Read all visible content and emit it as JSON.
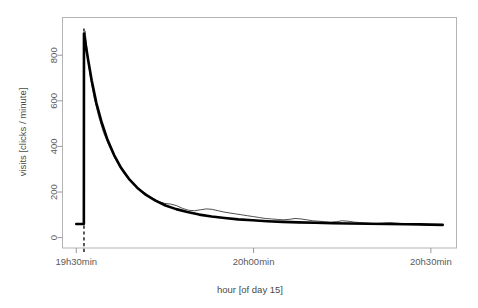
{
  "chart_data": {
    "type": "line",
    "title": "",
    "subtitle": "",
    "xlabel": "hour [of day 15]",
    "ylabel": "visits [clicks / minute]",
    "xlim": [
      0,
      62
    ],
    "ylim": [
      0,
      920
    ],
    "grid": false,
    "legend": false,
    "legend_position": "none",
    "x_tick_labels": [
      "19h30min",
      "20h00min",
      "20h30min"
    ],
    "x_tick_values": [
      0,
      30,
      60
    ],
    "y_tick_labels": [
      "0",
      "200",
      "400",
      "600",
      "800"
    ],
    "y_tick_values": [
      0,
      200,
      400,
      600,
      800
    ],
    "annotations": [
      {
        "name": "event-onset-dashed-line",
        "type": "vertical-dashed-line",
        "x": 1.3,
        "label": ""
      }
    ],
    "series": [
      {
        "name": "measured visits",
        "style": "thin-line",
        "color": "#3b3b3b",
        "x": [
          0,
          0.4,
          0.8,
          1.1,
          1.25,
          1.3,
          1.5,
          1.9,
          2.4,
          3.0,
          3.8,
          4.6,
          5.5,
          6.4,
          7.3,
          8.2,
          9.1,
          10.0,
          11.0,
          12.0,
          13.0,
          14.0,
          15.0,
          16.0,
          17.0,
          18.0,
          19.0,
          20.0,
          21.0,
          22.0,
          23.0,
          24.0,
          25.0,
          26.0,
          27.0,
          28.0,
          29.0,
          30.0,
          31.0,
          32.0,
          33.0,
          34.0,
          35.0,
          36.0,
          37.0,
          38.0,
          39.0,
          40.0,
          41.0,
          42.0,
          43.0,
          44.0,
          45.0,
          46.0,
          47.0,
          48.0,
          49.0,
          50.0,
          51.0,
          52.0,
          53.0,
          54.0,
          55.0,
          56.0,
          57.0,
          58.0,
          59.0,
          60.0,
          61.0,
          62.0
        ],
        "y": [
          60,
          60,
          60,
          60,
          62,
          880,
          905,
          800,
          700,
          615,
          530,
          462,
          405,
          355,
          312,
          276,
          248,
          226,
          205,
          190,
          172,
          158,
          150,
          147,
          140,
          128,
          120,
          118,
          122,
          126,
          124,
          118,
          112,
          108,
          104,
          100,
          96,
          92,
          88,
          84,
          82,
          80,
          78,
          80,
          84,
          82,
          78,
          74,
          72,
          70,
          68,
          70,
          74,
          72,
          68,
          66,
          64,
          62,
          62,
          64,
          66,
          64,
          62,
          60,
          58,
          58,
          56,
          56,
          55,
          55
        ]
      },
      {
        "name": "exponential fit",
        "style": "thick-line",
        "color": "#000000",
        "x": [
          0,
          0.5,
          1.0,
          1.28,
          1.3,
          1.6,
          2.0,
          2.6,
          3.4,
          4.3,
          5.3,
          6.4,
          7.6,
          8.9,
          10.3,
          11.8,
          13.4,
          15.1,
          16.9,
          18.8,
          20.8,
          22.9,
          25.1,
          27.4,
          29.8,
          32.3,
          34.9,
          37.6,
          40.4,
          43.3,
          46.3,
          49.4,
          52.6,
          55.9,
          58.0,
          60.0,
          62.0
        ],
        "y": [
          60,
          60,
          60,
          60,
          895,
          845,
          780,
          690,
          590,
          505,
          428,
          362,
          305,
          258,
          219,
          187,
          162,
          141,
          125,
          112,
          101,
          93,
          86,
          80,
          76,
          72,
          69,
          67,
          65,
          63,
          62,
          61,
          60,
          59,
          58,
          57,
          56
        ]
      }
    ]
  }
}
